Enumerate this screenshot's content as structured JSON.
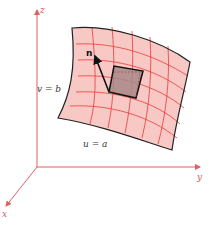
{
  "figure": {
    "axes": {
      "z_label": "z",
      "y_label": "y",
      "x_label": "x",
      "color": "#e06060"
    },
    "labels": {
      "normal": "n",
      "v_curve": "v = b",
      "u_curve": "u = a"
    },
    "colors": {
      "surface_fill": "#f8c8c4",
      "grid_lines": "#e83a3a",
      "surface_edge": "#222222",
      "patch_fill": "#a88888",
      "normal_vector": "#111111"
    }
  }
}
